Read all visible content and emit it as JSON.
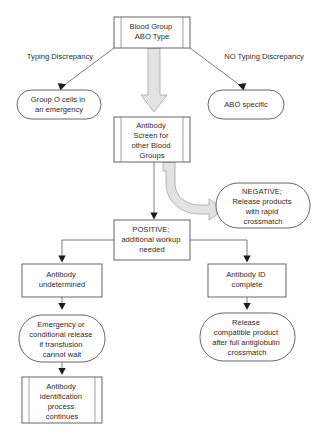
{
  "diagram": {
    "colors": {
      "node_fill": "#ffffff",
      "node_stroke": "#3f3f3f",
      "block_arrow_fill": "#e3e3e3",
      "block_arrow_stroke": "#9a9a9a",
      "connector": "#5a5a5a",
      "text": "#2b2b2b",
      "background": "#ffffff"
    },
    "nodes": {
      "blood_group": {
        "shape": "predefined-process",
        "lines": [
          "Blood Group",
          "ABO Type"
        ]
      },
      "group_o_cells": {
        "shape": "rounded-oval",
        "lines": [
          "Group O cells in",
          "an emergency"
        ]
      },
      "abo_specific": {
        "shape": "rounded-oval",
        "lines": [
          "ABO specific"
        ]
      },
      "antibody_screen": {
        "shape": "predefined-process",
        "lines": [
          "Antibody",
          "Screen for",
          "other Blood",
          "Groups"
        ]
      },
      "negative": {
        "shape": "rounded-oval",
        "lines": [
          "NEGATIVE;",
          "Release products",
          "with rapid",
          "crossmatch"
        ]
      },
      "positive": {
        "shape": "rectangle",
        "lines": [
          "POSITIVE;",
          "additional workup",
          "needed"
        ]
      },
      "antibody_undetermined": {
        "shape": "rectangle",
        "lines": [
          "Antibody",
          "undetermined"
        ]
      },
      "antibody_id_complete": {
        "shape": "rectangle",
        "lines": [
          "Antibody ID",
          "complete"
        ]
      },
      "emergency_release": {
        "shape": "rounded-oval",
        "lines": [
          "Emergency or",
          "conditional release",
          "if transfusion",
          "cannot wait"
        ]
      },
      "release_compatible": {
        "shape": "rounded-oval",
        "lines": [
          "Release",
          "compatible product",
          "after full antiglobulin",
          "crossmatch"
        ]
      },
      "antibody_identification": {
        "shape": "predefined-process",
        "lines": [
          "Antibody",
          "identification",
          "process",
          "continues"
        ]
      }
    },
    "edge_labels": {
      "typing_discrepancy": "Typing Discrepancy",
      "no_typing_discrepancy": "NO Typing Discrepancy"
    }
  }
}
